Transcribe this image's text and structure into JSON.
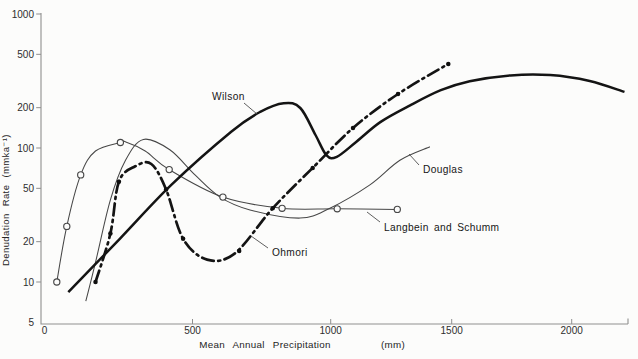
{
  "chart_data": {
    "type": "line",
    "title": "",
    "xlabel": "Mean Annual Precipitation",
    "xlabel_unit": "(mm)",
    "ylabel": "Denudation Rate (mmka⁻¹)",
    "x_axis": {
      "min": 0,
      "max": 2250,
      "scale": "linear",
      "ticks": [
        0,
        500,
        1000,
        1500,
        2000
      ]
    },
    "y_axis": {
      "min": 5,
      "max": 1000,
      "scale": "log",
      "ticks": [
        1000,
        500,
        200,
        100,
        50,
        20,
        10,
        5
      ]
    },
    "grid": false,
    "legend_position": "inline-labels",
    "series": [
      {
        "name": "Wilson",
        "line": "thick-solid",
        "marker": "none",
        "points": [
          [
            90,
            8.4
          ],
          [
            260,
            21
          ],
          [
            430,
            53
          ],
          [
            640,
            132
          ],
          [
            745,
            186
          ],
          [
            830,
            216
          ],
          [
            890,
            199
          ],
          [
            945,
            125
          ],
          [
            985,
            88
          ],
          [
            1025,
            86
          ],
          [
            1100,
            109
          ],
          [
            1205,
            156
          ],
          [
            1330,
            209
          ],
          [
            1455,
            270
          ],
          [
            1575,
            315
          ],
          [
            1745,
            348
          ],
          [
            1910,
            350
          ],
          [
            2075,
            316
          ],
          [
            2220,
            262
          ]
        ]
      },
      {
        "name": "Ohmori",
        "line": "thick-dash-dot",
        "marker": "filled-dot",
        "points": [
          [
            180,
            10
          ],
          [
            229,
            23
          ],
          [
            257,
            56
          ],
          [
            311,
            73
          ],
          [
            364,
            76
          ],
          [
            413,
            49
          ],
          [
            469,
            21
          ],
          [
            553,
            14.7
          ],
          [
            654,
            16.4
          ],
          [
            790,
            35.5
          ],
          [
            935,
            71
          ],
          [
            1092,
            141
          ],
          [
            1278,
            253
          ],
          [
            1486,
            424
          ]
        ],
        "marker_points": [
          [
            180,
            10
          ],
          [
            229,
            23
          ],
          [
            257,
            56
          ],
          [
            413,
            49
          ],
          [
            469,
            21
          ],
          [
            669,
            17
          ],
          [
            790,
            35.5
          ],
          [
            935,
            71
          ],
          [
            1092,
            141
          ],
          [
            1278,
            253
          ],
          [
            1486,
            424
          ]
        ]
      },
      {
        "name": "Douglas",
        "line": "thin-solid",
        "marker": "none",
        "points": [
          [
            148,
            7.2
          ],
          [
            180,
            14
          ],
          [
            229,
            41
          ],
          [
            279,
            81
          ],
          [
            338,
            116
          ],
          [
            425,
            97
          ],
          [
            509,
            63
          ],
          [
            600,
            43
          ],
          [
            708,
            34.5
          ],
          [
            889,
            30
          ],
          [
            997,
            35.5
          ],
          [
            1162,
            53
          ],
          [
            1286,
            81
          ],
          [
            1410,
            102
          ]
        ]
      },
      {
        "name": "Langbein and Schumm",
        "line": "thin-solid",
        "marker": "open-circle",
        "points": [
          [
            52,
            10
          ],
          [
            85,
            26
          ],
          [
            131,
            63
          ],
          [
            180,
            95
          ],
          [
            262,
            110
          ],
          [
            280,
            111
          ],
          [
            344,
            95
          ],
          [
            423,
            69
          ],
          [
            610,
            43
          ],
          [
            824,
            35.5
          ],
          [
            1027,
            35.2
          ],
          [
            1275,
            34.8
          ]
        ],
        "marker_points": [
          [
            52,
            10
          ],
          [
            85,
            26
          ],
          [
            131,
            63
          ],
          [
            262,
            110
          ],
          [
            423,
            69
          ],
          [
            610,
            43
          ],
          [
            824,
            35.5
          ],
          [
            1027,
            35.2
          ],
          [
            1275,
            34.8
          ]
        ]
      }
    ],
    "colors": {
      "heavy_curve": "#141414",
      "thin_curve": "#474747",
      "axis": "#8f8f8f",
      "background": "#fcfcfb"
    }
  }
}
